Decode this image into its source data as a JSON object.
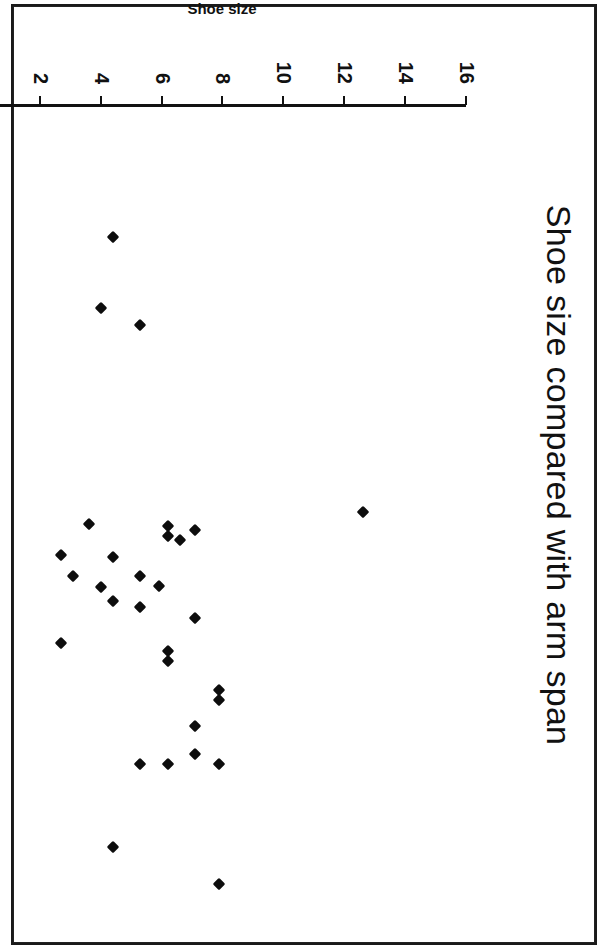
{
  "chart_data": {
    "type": "scatter",
    "title": "Shoe size compared with arm span",
    "xlabel": "Arm span (cms)",
    "ylabel": "Shoe size",
    "xlim": [
      100.0,
      190.0
    ],
    "ylim": [
      0,
      16
    ],
    "xticks": [
      "100.0",
      "110.0",
      "120.0",
      "130.0",
      "140.0",
      "150.0",
      "160.0",
      "170.0",
      "180.0",
      "190.0"
    ],
    "xtick_values": [
      100,
      110,
      120,
      130,
      140,
      150,
      160,
      170,
      180,
      190
    ],
    "yticks": [
      "0",
      "2",
      "4",
      "6",
      "8",
      "10",
      "12",
      "14",
      "16"
    ],
    "ytick_values": [
      0,
      2,
      4,
      6,
      8,
      10,
      12,
      14,
      16
    ],
    "grid": false,
    "legend": null,
    "marker": "diamond",
    "marker_color": "#0d0d0d",
    "rotation_deg": 90,
    "points": [
      {
        "x": 184.0,
        "y": 7.9
      },
      {
        "x": 180.0,
        "y": 4.4
      },
      {
        "x": 171.0,
        "y": 7.9
      },
      {
        "x": 170.0,
        "y": 7.1
      },
      {
        "x": 171.0,
        "y": 6.2
      },
      {
        "x": 171.0,
        "y": 5.3
      },
      {
        "x": 167.0,
        "y": 7.1
      },
      {
        "x": 164.2,
        "y": 7.9
      },
      {
        "x": 163.1,
        "y": 7.9
      },
      {
        "x": 160.0,
        "y": 6.2
      },
      {
        "x": 158.9,
        "y": 6.2
      },
      {
        "x": 158.0,
        "y": 2.7
      },
      {
        "x": 155.3,
        "y": 7.1
      },
      {
        "x": 154.2,
        "y": 5.3
      },
      {
        "x": 153.5,
        "y": 4.4
      },
      {
        "x": 152.0,
        "y": 4.0
      },
      {
        "x": 151.9,
        "y": 5.9
      },
      {
        "x": 150.8,
        "y": 5.3
      },
      {
        "x": 150.8,
        "y": 3.1
      },
      {
        "x": 148.8,
        "y": 4.4
      },
      {
        "x": 148.5,
        "y": 2.7
      },
      {
        "x": 146.9,
        "y": 6.6
      },
      {
        "x": 146.5,
        "y": 6.2
      },
      {
        "x": 145.9,
        "y": 7.1
      },
      {
        "x": 145.4,
        "y": 6.2
      },
      {
        "x": 145.2,
        "y": 3.6
      },
      {
        "x": 143.9,
        "y": 12.6
      },
      {
        "x": 123.8,
        "y": 5.3
      },
      {
        "x": 122.0,
        "y": 4.0
      },
      {
        "x": 114.3,
        "y": 4.4
      }
    ]
  },
  "page": {
    "background": "#ffffff",
    "border_color": "#1a1a1a"
  }
}
